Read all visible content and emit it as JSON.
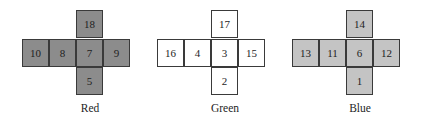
{
  "nets": [
    {
      "name": "Red",
      "fill": "#8c8c8c",
      "top": "18",
      "row": [
        "10",
        "8",
        "7",
        "9"
      ],
      "bottom": "5"
    },
    {
      "name": "Green",
      "fill": "#ffffff",
      "top": "17",
      "row": [
        "16",
        "4",
        "3",
        "15"
      ],
      "bottom": "2"
    },
    {
      "name": "Blue",
      "fill": "#c4c4c4",
      "top": "14",
      "row": [
        "13",
        "11",
        "6",
        "12"
      ],
      "bottom": "1"
    }
  ]
}
